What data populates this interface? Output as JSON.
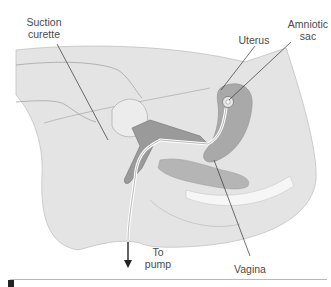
{
  "figure": {
    "labels": {
      "suction_curette": "Suction\ncurette",
      "uterus": "Uterus",
      "amniotic_sac": "Amniotic\nsac",
      "to_pump": "To\npump",
      "vagina": "Vagina"
    },
    "colors": {
      "body_fill": "#e4e4e4",
      "body_outline": "#bdbdbd",
      "uterus_fill": "#a9a9a9",
      "organ_fill": "#b9b9b9",
      "bone_fill": "#f4f4f4",
      "leader_line": "#333333",
      "label_text": "#4a4a4a"
    }
  }
}
